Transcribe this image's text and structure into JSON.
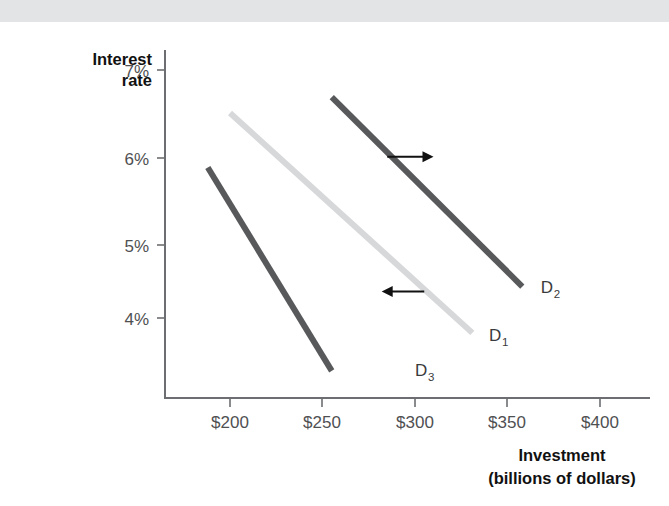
{
  "figure": {
    "background_color": "#ffffff",
    "top_band_color": "#e3e4e6",
    "axis_color": "#6d6e71"
  },
  "chart_data": {
    "type": "line",
    "title": "",
    "xlabel": "Investment",
    "xlabel_sub": "(billions of dollars)",
    "ylabel": "Interest",
    "ylabel_line2": "rate",
    "xlim": [
      175,
      420
    ],
    "ylim": [
      3.2,
      7.3
    ],
    "xticks": [
      200,
      250,
      300,
      350,
      400
    ],
    "xticklabels": [
      "$200",
      "$250",
      "$300",
      "$350",
      "$400"
    ],
    "yticks": [
      4,
      5,
      6,
      7
    ],
    "yticklabels": [
      "4%",
      "5%",
      "6%",
      "7%"
    ],
    "grid": false,
    "legend": "inline-labels",
    "series": [
      {
        "name": "D3",
        "label": "D",
        "subscript": "3",
        "color": "#58595b",
        "linewidth": 6,
        "x": [
          188,
          255
        ],
        "y": [
          5.82,
          3.36
        ],
        "label_x": 300,
        "label_y": 3.3
      },
      {
        "name": "D1",
        "label": "D",
        "subscript": "1",
        "color": "#d7d8da",
        "linewidth": 6,
        "x": [
          200,
          331
        ],
        "y": [
          6.48,
          3.82
        ],
        "label_x": 340,
        "label_y": 3.72
      },
      {
        "name": "D2",
        "label": "D",
        "subscript": "2",
        "color": "#58595b",
        "linewidth": 6,
        "x": [
          255,
          358
        ],
        "y": [
          6.67,
          4.38
        ],
        "label_x": 368,
        "label_y": 4.3
      }
    ],
    "annotations": [
      {
        "name": "shift-right-arrow",
        "direction": "right",
        "x_start": 285,
        "x_end": 310,
        "y": 5.95
      },
      {
        "name": "shift-left-arrow",
        "direction": "left",
        "x_start": 305,
        "x_end": 282,
        "y": 4.32
      }
    ]
  }
}
